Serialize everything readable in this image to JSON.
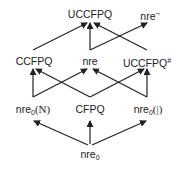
{
  "diagram": {
    "type": "hasse-diagram",
    "nodes": {
      "uccfpq": {
        "label": "UCCFPQ"
      },
      "nre_neg": {
        "base": "nre",
        "sup": "¬"
      },
      "ccfpq": {
        "label": "CCFPQ"
      },
      "nre": {
        "label": "nre"
      },
      "uccfpq_hash": {
        "base": "UCCFPQ",
        "sup": "#"
      },
      "nre0_n": {
        "base": "nre",
        "sub": "0",
        "arg": "(N)"
      },
      "cfpq": {
        "label": "CFPQ"
      },
      "nre0_bar": {
        "base": "nre",
        "sub": "0",
        "arg": "(|)"
      },
      "nre0": {
        "base": "nre",
        "sub": "0"
      }
    },
    "edges": [
      [
        "nre0",
        "nre0_n"
      ],
      [
        "nre0",
        "cfpq"
      ],
      [
        "nre0",
        "nre0_bar"
      ],
      [
        "nre0_n",
        "ccfpq"
      ],
      [
        "nre0_n",
        "nre"
      ],
      [
        "cfpq",
        "ccfpq"
      ],
      [
        "cfpq",
        "uccfpq_hash"
      ],
      [
        "nre0_bar",
        "nre"
      ],
      [
        "nre0_bar",
        "uccfpq_hash"
      ],
      [
        "ccfpq",
        "uccfpq"
      ],
      [
        "nre",
        "uccfpq"
      ],
      [
        "nre",
        "nre_neg"
      ],
      [
        "uccfpq_hash",
        "uccfpq"
      ]
    ]
  }
}
